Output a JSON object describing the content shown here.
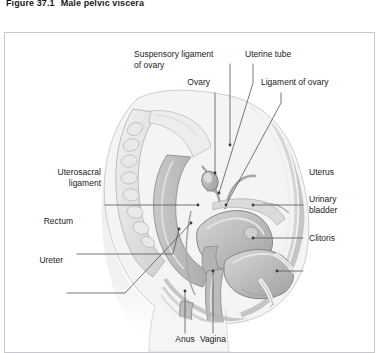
{
  "caption": {
    "number": "Figure 37.1",
    "title": "Male pelvic viscera"
  },
  "figure": {
    "type": "anatomical-illustration",
    "style": "grayscale line and tone drawing",
    "colors": {
      "frame_border": "#c8c8cc",
      "page_background": "#ffffff",
      "leader_line": "#555555",
      "label_text": "#1a1a1a",
      "tissue_light": "#e6e6e6",
      "tissue_mid": "#c4c4c4",
      "tissue_dark": "#9a9a9a",
      "outline": "#8a8a8a"
    }
  },
  "labels": [
    {
      "id": "suspensory-ligament-of-ovary",
      "line1": "Suspensory ligament",
      "line2": "of ovary",
      "align": "left"
    },
    {
      "id": "uterine-tube",
      "line1": "Uterine tube",
      "line2": "",
      "align": "left"
    },
    {
      "id": "ovary",
      "line1": "Ovary",
      "line2": "",
      "align": "right"
    },
    {
      "id": "ligament-of-ovary",
      "line1": "Ligament of ovary",
      "line2": "",
      "align": "left"
    },
    {
      "id": "uterosacral-ligament",
      "line1": "Uterosacral",
      "line2": "ligament",
      "align": "right"
    },
    {
      "id": "rectum",
      "line1": "Rectum",
      "line2": "",
      "align": "right"
    },
    {
      "id": "ureter",
      "line1": "Ureter",
      "line2": "",
      "align": "right"
    },
    {
      "id": "uterus",
      "line1": "Uterus",
      "line2": "",
      "align": "left"
    },
    {
      "id": "urinary-bladder",
      "line1": "Urinary",
      "line2": "bladder",
      "align": "left"
    },
    {
      "id": "clitoris",
      "line1": "Clitoris",
      "line2": "",
      "align": "left"
    },
    {
      "id": "anus",
      "line1": "Anus",
      "line2": "",
      "align": "center"
    },
    {
      "id": "vagina",
      "line1": "Vagina",
      "line2": "",
      "align": "center"
    }
  ]
}
